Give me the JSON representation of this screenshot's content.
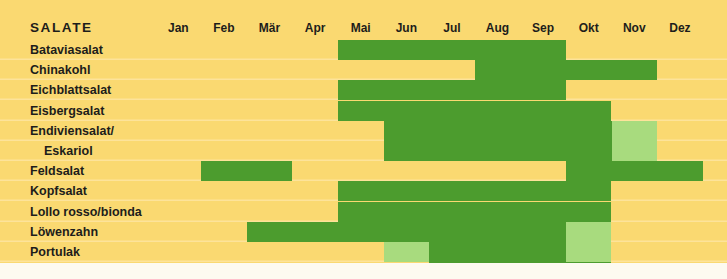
{
  "header": {
    "group_title": "SALATE",
    "months": [
      "Jan",
      "Feb",
      "Mär",
      "Apr",
      "Mai",
      "Jun",
      "Jul",
      "Aug",
      "Sep",
      "Okt",
      "Nov",
      "Dez"
    ]
  },
  "colors": {
    "background": "#fad971",
    "row_divider": "#fde39a",
    "season_full": "#4c9c2e",
    "season_partial": "#a8db7e",
    "text": "#1d1d1b",
    "page": "#fdfaf0"
  },
  "legend": {
    "full_label": "Saison (Freiland / Hauptsaison)",
    "partial_label": "Lager / Nebensaison"
  },
  "chart_data": {
    "type": "heatmap",
    "title": "SALATE",
    "xlabel": "",
    "ylabel": "",
    "grid": false,
    "legend_position": "none",
    "categories": [
      "Jan",
      "Feb",
      "Mär",
      "Apr",
      "Mai",
      "Jun",
      "Jul",
      "Aug",
      "Sep",
      "Okt",
      "Nov",
      "Dez"
    ],
    "value_scale": {
      "0": "none",
      "1": "partial",
      "2": "full"
    },
    "rows": [
      {
        "label": "Bataviasalat",
        "indent": false,
        "values": [
          0,
          0,
          0,
          0,
          2,
          2,
          2,
          2,
          2,
          0,
          0,
          0
        ]
      },
      {
        "label": "Chinakohl",
        "indent": false,
        "values": [
          0,
          0,
          0,
          0,
          0,
          0,
          0,
          2,
          2,
          2,
          2,
          0
        ]
      },
      {
        "label": "Eichblattsalat",
        "indent": false,
        "values": [
          0,
          0,
          0,
          0,
          2,
          2,
          2,
          2,
          2,
          0,
          0,
          0
        ]
      },
      {
        "label": "Eisbergsalat",
        "indent": false,
        "values": [
          0,
          0,
          0,
          0,
          2,
          2,
          2,
          2,
          2,
          2,
          0,
          0
        ]
      },
      {
        "label": "Endiviensalat/",
        "indent": false,
        "values": [
          0,
          0,
          0,
          0,
          0,
          2,
          2,
          2,
          2,
          2,
          1,
          0
        ]
      },
      {
        "label": "Eskariol",
        "indent": true,
        "values": [
          0,
          0,
          0,
          0,
          0,
          2,
          2,
          2,
          2,
          2,
          1,
          0
        ]
      },
      {
        "label": "Feldsalat",
        "indent": false,
        "values": [
          0,
          2,
          2,
          0,
          0,
          0,
          0,
          0,
          0,
          2,
          2,
          2
        ]
      },
      {
        "label": "Kopfsalat",
        "indent": false,
        "values": [
          0,
          0,
          0,
          0,
          2,
          2,
          2,
          2,
          2,
          2,
          0,
          0
        ]
      },
      {
        "label": "Lollo rosso/bionda",
        "indent": false,
        "values": [
          0,
          0,
          0,
          0,
          2,
          2,
          2,
          2,
          2,
          2,
          0,
          0
        ]
      },
      {
        "label": "Löwenzahn",
        "indent": false,
        "values": [
          0,
          0,
          2,
          2,
          2,
          2,
          2,
          2,
          2,
          1,
          0,
          0
        ]
      },
      {
        "label": "Portulak",
        "indent": false,
        "values": [
          0,
          0,
          0,
          0,
          0,
          1,
          2,
          2,
          2,
          1,
          0,
          0
        ]
      },
      {
        "label": "Radicchio",
        "indent": false,
        "values": [
          0,
          0,
          0,
          0,
          0,
          0,
          2,
          2,
          2,
          2,
          0,
          0
        ]
      }
    ]
  }
}
